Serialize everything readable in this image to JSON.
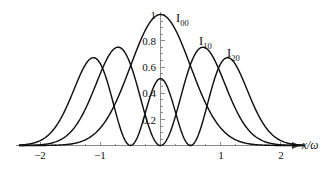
{
  "figure": {
    "background_color": "#ffffff",
    "curve_color": "#111111",
    "axis_color": "#8a8a8a",
    "text_color": "#111111"
  },
  "axis_title": {
    "text": "x/ω"
  },
  "curve_labels": [
    {
      "base": "I",
      "sub": "00",
      "x": 176,
      "y": 12
    },
    {
      "base": "I",
      "sub": "10",
      "x": 199,
      "y": 35
    },
    {
      "base": "I",
      "sub": "20",
      "x": 227,
      "y": 47
    }
  ],
  "chart_data": {
    "type": "line",
    "title": "",
    "xlabel": "x/ω",
    "ylabel": "",
    "xlim": [
      -2.35,
      2.4
    ],
    "ylim": [
      0,
      1.05
    ],
    "grid": false,
    "legend": "inline-annotations",
    "xticks": [
      -2,
      -1,
      1,
      2
    ],
    "xtick_labels": [
      "−2",
      "−1",
      "1",
      "2"
    ],
    "yticks": [
      0.2,
      0.4,
      0.6,
      0.8,
      1
    ],
    "ytick_labels": [
      "0.2",
      "0.4",
      "0.6",
      "0.8",
      "1"
    ],
    "x_minor_tick_step": 0.25,
    "y_minor_tick_step": 0.05,
    "series": [
      {
        "name": "I00",
        "description": "Fundamental Gaussian mode intensity, single lobe centered at x=0",
        "formula": "exp(-2 x^2)",
        "peaks": [
          {
            "x": 0,
            "y": 1.0
          }
        ],
        "zeros": [],
        "x": [
          -2.0,
          -1.75,
          -1.5,
          -1.25,
          -1.0,
          -0.75,
          -0.5,
          -0.25,
          0,
          0.25,
          0.5,
          0.75,
          1.0,
          1.25,
          1.5,
          1.75,
          2.0
        ],
        "values": [
          0.0003,
          0.0022,
          0.0111,
          0.0439,
          0.1353,
          0.3247,
          0.6065,
          0.8825,
          1.0,
          0.8825,
          0.6065,
          0.3247,
          0.1353,
          0.0439,
          0.0111,
          0.0022,
          0.0003
        ]
      },
      {
        "name": "I10",
        "description": "First-order Hermite-Gaussian intensity, two lobes with node at x=0",
        "formula": "4 x^2 exp(-2 x^2 + 1)",
        "peaks": [
          {
            "x": -0.72,
            "y": 0.75
          },
          {
            "x": 0.72,
            "y": 0.75
          }
        ],
        "zeros": [
          0
        ],
        "x": [
          -2.0,
          -1.75,
          -1.5,
          -1.25,
          -1.0,
          -0.72,
          -0.5,
          -0.25,
          0,
          0.25,
          0.5,
          0.72,
          1.0,
          1.25,
          1.5,
          1.75,
          2.0
        ],
        "values": [
          0.0028,
          0.0178,
          0.0679,
          0.1864,
          0.3679,
          0.75,
          0.4122,
          0.1499,
          0.0,
          0.1499,
          0.4122,
          0.75,
          0.3679,
          0.1864,
          0.0679,
          0.0178,
          0.0028
        ],
        "left_peak_x": -0.72,
        "right_peak_x": 0.72
      },
      {
        "name": "I20",
        "description": "Second-order Hermite-Gaussian intensity, three lobes, small central lobe and two outer lobes",
        "formula": "(2 x^2 - 0.5)^2 exp(-2 x^2) normalized",
        "peaks": [
          {
            "x": -1.13,
            "y": 0.67
          },
          {
            "x": 0,
            "y": 0.47
          },
          {
            "x": 1.13,
            "y": 0.67
          }
        ],
        "zeros": [
          -0.5,
          0.5
        ],
        "x": [
          -2.2,
          -2.0,
          -1.75,
          -1.5,
          -1.3,
          -1.13,
          -0.95,
          -0.75,
          -0.5,
          -0.25,
          0,
          0.25,
          0.5,
          0.75,
          0.95,
          1.13,
          1.3,
          1.5,
          1.75,
          2.0,
          2.2
        ],
        "values": [
          0.06,
          0.17,
          0.38,
          0.57,
          0.65,
          0.67,
          0.62,
          0.38,
          0.0,
          0.27,
          0.47,
          0.27,
          0.0,
          0.38,
          0.62,
          0.67,
          0.65,
          0.57,
          0.38,
          0.17,
          0.06
        ],
        "central_peak_y": 0.47,
        "outer_peak_y": 0.67
      }
    ],
    "annotations": [
      {
        "text": "I00",
        "target_series": "I00"
      },
      {
        "text": "I10",
        "target_series": "I10"
      },
      {
        "text": "I20",
        "target_series": "I20"
      }
    ]
  }
}
